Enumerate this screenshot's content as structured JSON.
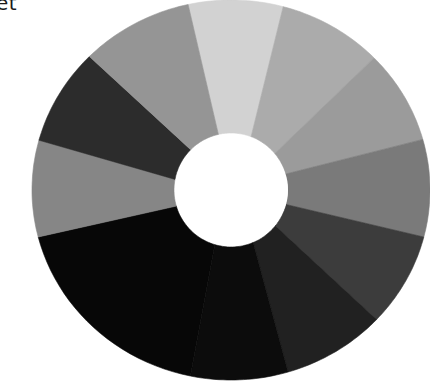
{
  "caption": {
    "text": "et"
  },
  "wheel": {
    "center": [
      231,
      190
    ],
    "outer_rx": 199,
    "outer_ry": 190,
    "inner_r": 55,
    "hole_color": "#ffffff",
    "segments": [
      {
        "name": "segment-top-lightest",
        "color": "#d2d2d2",
        "outer_start": [
          188,
          4
        ],
        "outer_end": [
          284,
          4
        ],
        "inner_start": [
          219,
          137
        ],
        "inner_end": [
          251,
          137
        ]
      },
      {
        "name": "segment-upper-right",
        "color": "#ababab",
        "outer_start": [
          284,
          4
        ],
        "outer_end": [
          376,
          56
        ],
        "inner_start": [
          251,
          137
        ],
        "inner_end": [
          279,
          150
        ]
      },
      {
        "name": "segment-right-upper",
        "color": "#9b9b9b",
        "outer_start": [
          376,
          56
        ],
        "outer_end": [
          428,
          138
        ],
        "inner_start": [
          279,
          150
        ],
        "inner_end": [
          289,
          173
        ]
      },
      {
        "name": "segment-right-middle",
        "color": "#7a7a7a",
        "outer_start": [
          428,
          138
        ],
        "outer_end": [
          428,
          238
        ],
        "inner_start": [
          289,
          173
        ],
        "inner_end": [
          288,
          205
        ]
      },
      {
        "name": "segment-right-lower",
        "color": "#3c3c3c",
        "outer_start": [
          428,
          238
        ],
        "outer_end": [
          375,
          318
        ],
        "inner_start": [
          288,
          205
        ],
        "inner_end": [
          278,
          228
        ]
      },
      {
        "name": "segment-bottom-right",
        "color": "#212121",
        "outer_start": [
          375,
          318
        ],
        "outer_end": [
          290,
          378
        ],
        "inner_start": [
          278,
          228
        ],
        "inner_end": [
          253,
          242
        ]
      },
      {
        "name": "segment-bottom",
        "color": "#0c0c0c",
        "outer_start": [
          290,
          378
        ],
        "outer_end": [
          190,
          378
        ],
        "inner_start": [
          253,
          242
        ],
        "inner_end": [
          215,
          244
        ]
      },
      {
        "name": "segment-bottom-left",
        "color": "#070707",
        "outer_start": [
          190,
          378
        ],
        "outer_end": [
          38,
          237
        ],
        "inner_start": [
          215,
          244
        ],
        "inner_end": [
          180,
          205
        ]
      },
      {
        "name": "segment-left",
        "color": "#868686",
        "outer_start": [
          38,
          237
        ],
        "outer_end": [
          38,
          140
        ],
        "inner_start": [
          180,
          205
        ],
        "inner_end": [
          178,
          180
        ]
      },
      {
        "name": "segment-upper-left-dark",
        "color": "#2c2c2c",
        "outer_start": [
          38,
          140
        ],
        "outer_end": [
          91,
          58
        ],
        "inner_start": [
          178,
          180
        ],
        "inner_end": [
          192,
          151
        ]
      },
      {
        "name": "segment-upper-left",
        "color": "#959595",
        "outer_start": [
          91,
          58
        ],
        "outer_end": [
          188,
          4
        ],
        "inner_start": [
          192,
          151
        ],
        "inner_end": [
          219,
          137
        ]
      }
    ]
  }
}
